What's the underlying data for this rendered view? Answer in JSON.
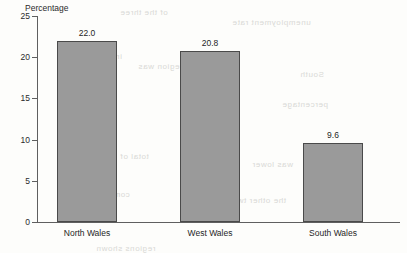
{
  "chart_data": {
    "type": "bar",
    "title": "",
    "subtitle": "",
    "xlabel": "",
    "ylabel": "Percentage",
    "categories": [
      "North Wales",
      "West Wales",
      "South Wales"
    ],
    "values": [
      22.0,
      20.8,
      9.6
    ],
    "value_labels": [
      "22.0",
      "20.8",
      "9.6"
    ],
    "ylim": [
      0,
      25
    ],
    "y_ticks": [
      0,
      5,
      10,
      15,
      20,
      25
    ],
    "y_tick_labels": [
      "0",
      "5",
      "10",
      "15",
      "20",
      "25"
    ],
    "grid": false,
    "legend": false,
    "bar_color": "#9a9a9a",
    "bar_border_color": "#4a4a4a",
    "axis_color": "#5f5f5f",
    "background_color": "#fdfdfb",
    "annotations": []
  },
  "bleed_text": [
    {
      "text": "of the three",
      "left": 120,
      "top": 8
    },
    {
      "text": "unemployment rate",
      "left": 232,
      "top": 18
    },
    {
      "text": "in each",
      "left": 92,
      "top": 52
    },
    {
      "text": "the region was",
      "left": 138,
      "top": 62
    },
    {
      "text": "South",
      "left": 300,
      "top": 70
    },
    {
      "text": "figures for",
      "left": 60,
      "top": 104
    },
    {
      "text": "and the",
      "left": 196,
      "top": 112
    },
    {
      "text": "percentage",
      "left": 282,
      "top": 100
    },
    {
      "text": "total of",
      "left": 120,
      "top": 152
    },
    {
      "text": "was lower",
      "left": 252,
      "top": 160
    },
    {
      "text": "compared with",
      "left": 70,
      "top": 190
    },
    {
      "text": "the other two",
      "left": 232,
      "top": 196
    },
    {
      "text": "regions shown",
      "left": 96,
      "top": 244
    }
  ]
}
